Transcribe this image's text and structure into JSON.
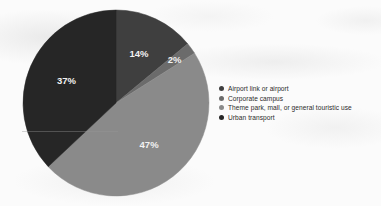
{
  "chart_data": {
    "type": "pie",
    "title": "",
    "subtitle": "",
    "xlabel": "",
    "ylabel": "",
    "legend_position": "right",
    "grid": false,
    "categories": [
      "Airport link or airport",
      "Corporate campus",
      "Theme park, mall, or general touristic use",
      "Urban transport"
    ],
    "values": [
      14,
      2,
      47,
      37
    ],
    "value_unit": "%",
    "data_labels": [
      "14%",
      "2%",
      "47%",
      "37%"
    ],
    "colors": [
      "#3f3f3f",
      "#6b6b6b",
      "#8a8a8a",
      "#262626"
    ],
    "start_angle_deg": 0,
    "direction": "clockwise"
  },
  "page": {
    "background_color": "#fbfbfb"
  },
  "pie": {
    "label_color": "#f2f2f2",
    "slices": [
      {
        "label": "14%",
        "value": 14,
        "color": "#3f3f3f",
        "name": "Airport link or airport"
      },
      {
        "label": "2%",
        "value": 2,
        "color": "#6b6b6b",
        "name": "Corporate campus"
      },
      {
        "label": "47%",
        "value": 47,
        "color": "#8a8a8a",
        "name": "Theme park, mall, or general touristic use"
      },
      {
        "label": "37%",
        "value": 37,
        "color": "#262626",
        "name": "Urban transport"
      }
    ]
  },
  "legend": {
    "items": [
      {
        "label": "Airport link or airport",
        "color": "#3f3f3f"
      },
      {
        "label": "Corporate campus",
        "color": "#6b6b6b"
      },
      {
        "label": "Theme park, mall, or general touristic use",
        "color": "#8a8a8a"
      },
      {
        "label": "Urban transport",
        "color": "#262626"
      }
    ]
  }
}
